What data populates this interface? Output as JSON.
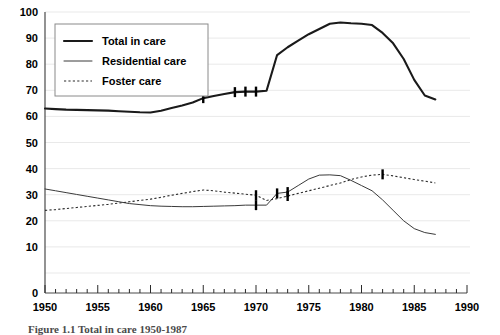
{
  "chart_data": {
    "type": "line",
    "title": "",
    "xlabel": "",
    "ylabel": "",
    "xlim": [
      1950,
      1990
    ],
    "ylim": [
      0,
      100
    ],
    "grid": true,
    "legend_position": "upper-left-inside",
    "xticks": [
      "1950",
      "1955",
      "1960",
      "1965",
      "1970",
      "1975",
      "1980",
      "1985",
      "1990"
    ],
    "yticks": [
      "0",
      "10",
      "20",
      "30",
      "40",
      "50",
      "60",
      "70",
      "80",
      "90",
      "100"
    ],
    "minor_xtick_interval": 1,
    "series": [
      {
        "name": "Total in care",
        "style": "thick-solid",
        "color": "#1a1a1a",
        "x": [
          1950,
          1951,
          1952,
          1953,
          1954,
          1955,
          1956,
          1957,
          1958,
          1959,
          1960,
          1961,
          1962,
          1963,
          1964,
          1965,
          1966,
          1967,
          1968,
          1969,
          1970,
          1971,
          1972,
          1973,
          1974,
          1975,
          1976,
          1977,
          1978,
          1979,
          1980,
          1981,
          1982,
          1983,
          1984,
          1985,
          1986,
          1987
        ],
        "values": [
          63.0,
          62.8,
          62.6,
          62.5,
          62.4,
          62.3,
          62.2,
          62.0,
          61.8,
          61.6,
          61.5,
          62.2,
          63.2,
          64.2,
          65.3,
          67.0,
          67.8,
          68.6,
          69.3,
          69.5,
          69.5,
          69.8,
          83.5,
          86.5,
          89.0,
          91.5,
          93.5,
          95.5,
          96.0,
          95.7,
          95.5,
          95.0,
          92.0,
          88.0,
          82.0,
          74.0,
          68.0,
          66.5
        ],
        "markers_at_x": [
          1965,
          1968,
          1969,
          1970
        ]
      },
      {
        "name": "Residential care",
        "style": "thin-solid",
        "color": "#3a3a3a",
        "x": [
          1950,
          1951,
          1952,
          1953,
          1954,
          1955,
          1956,
          1957,
          1958,
          1959,
          1960,
          1961,
          1962,
          1963,
          1964,
          1965,
          1966,
          1967,
          1968,
          1969,
          1970,
          1971,
          1972,
          1973,
          1974,
          1975,
          1976,
          1977,
          1978,
          1979,
          1980,
          1981,
          1982,
          1983,
          1984,
          1985,
          1986,
          1987
        ],
        "values": [
          32.2,
          31.5,
          30.8,
          30.1,
          29.4,
          28.7,
          28.0,
          27.3,
          26.6,
          26.2,
          25.8,
          25.6,
          25.5,
          25.4,
          25.4,
          25.5,
          25.6,
          25.7,
          25.8,
          26.0,
          26.0,
          26.0,
          30.5,
          31.0,
          33.5,
          36.0,
          37.5,
          37.6,
          37.3,
          35.5,
          33.5,
          31.5,
          28.0,
          24.0,
          20.0,
          17.0,
          15.5,
          14.8
        ],
        "markers_at_x": [
          1970,
          1972,
          1973
        ]
      },
      {
        "name": "Foster care",
        "style": "dotted",
        "color": "#2b2b2b",
        "x": [
          1950,
          1951,
          1952,
          1953,
          1954,
          1955,
          1956,
          1957,
          1958,
          1959,
          1960,
          1961,
          1962,
          1963,
          1964,
          1965,
          1966,
          1967,
          1968,
          1969,
          1970,
          1971,
          1972,
          1973,
          1974,
          1975,
          1976,
          1977,
          1978,
          1979,
          1980,
          1981,
          1982,
          1983,
          1984,
          1985,
          1986,
          1987
        ],
        "values": [
          24.0,
          24.3,
          24.7,
          25.1,
          25.5,
          25.9,
          26.3,
          26.8,
          27.3,
          27.8,
          28.3,
          29.0,
          29.8,
          30.5,
          31.2,
          31.8,
          31.5,
          31.0,
          30.6,
          30.2,
          29.8,
          27.8,
          28.5,
          29.5,
          30.5,
          31.5,
          32.5,
          33.5,
          34.5,
          35.8,
          36.8,
          37.5,
          37.8,
          37.2,
          36.5,
          35.8,
          35.2,
          34.5
        ],
        "markers_at_x": [
          1970,
          1973,
          1982
        ]
      }
    ]
  },
  "legend": {
    "items": [
      {
        "label": "Total in care",
        "style": "thick-solid"
      },
      {
        "label": "Residential care",
        "style": "thin-solid"
      },
      {
        "label": "Foster care",
        "style": "dotted"
      }
    ]
  },
  "caption": {
    "text": "Figure 1.1  Total in care 1950-1987"
  }
}
